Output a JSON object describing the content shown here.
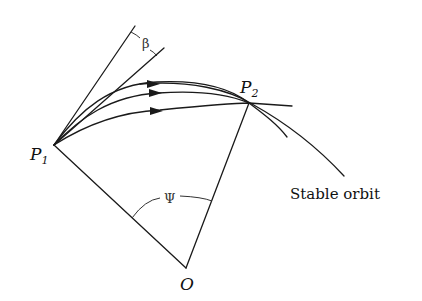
{
  "diagram": {
    "type": "orbital-transfer-geometry",
    "points": {
      "p1": {
        "label": "P",
        "subscript": "1"
      },
      "p2": {
        "label": "P",
        "subscript": "2"
      },
      "origin": {
        "label": "O"
      }
    },
    "angles": {
      "beta": {
        "label": "β"
      },
      "psi": {
        "label": "Ψ"
      }
    },
    "captions": {
      "stable_orbit": "Stable orbit"
    },
    "trajectory_count": 3,
    "colors": {
      "ink": "#1a1a1a",
      "background": "#ffffff"
    }
  }
}
